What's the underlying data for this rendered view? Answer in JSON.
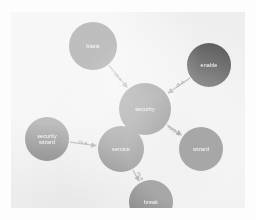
{
  "diagram": {
    "background_color": "#eeeeee",
    "page_background": "#fdfdfd",
    "node_color": "#6e6e6e",
    "node_color_dark": "#4a4a4a",
    "edge_color": "#9a9a9a",
    "node_label_color": "#ffffff",
    "edge_label_color": "#555555"
  },
  "chart_data": {
    "type": "diagram",
    "nodes": [
      {
        "id": "blank",
        "label": "blank",
        "label_lines": [
          "blank"
        ],
        "x": 82,
        "y": 34,
        "r": 24,
        "color": "#6e6e6e"
      },
      {
        "id": "enable",
        "label": "enable",
        "label_lines": [
          "enable"
        ],
        "x": 198,
        "y": 53,
        "r": 22,
        "color": "#4a4a4a"
      },
      {
        "id": "security",
        "label": "security",
        "label_lines": [
          "security"
        ],
        "x": 134,
        "y": 97,
        "r": 26,
        "color": "#6e6e6e"
      },
      {
        "id": "security-wizard",
        "label": "security wizard",
        "label_lines": [
          "security",
          "wizard"
        ],
        "x": 36,
        "y": 127,
        "r": 22,
        "color": "#6e6e6e"
      },
      {
        "id": "service",
        "label": "service",
        "label_lines": [
          "service"
        ],
        "x": 110,
        "y": 137,
        "r": 23,
        "color": "#6e6e6e"
      },
      {
        "id": "wizard",
        "label": "wizard",
        "label_lines": [
          "wizard"
        ],
        "x": 190,
        "y": 137,
        "r": 22,
        "color": "#6e6e6e"
      },
      {
        "id": "break",
        "label": "break",
        "label_lines": [
          "break"
        ],
        "x": 140,
        "y": 190,
        "r": 22,
        "color": "#6e6e6e"
      }
    ],
    "edges": [
      {
        "from": "blank",
        "to": "security",
        "label": "IS-A",
        "label_x": 106,
        "label_y": 66
      },
      {
        "from": "enable",
        "to": "security",
        "label": "IS-A",
        "label_x": 170,
        "label_y": 73
      },
      {
        "from": "security",
        "to": "wizard",
        "label": "HAS-A",
        "label_x": 162,
        "label_y": 120
      },
      {
        "from": "security-wizard",
        "to": "service",
        "label": "IS-A",
        "label_x": 72,
        "label_y": 132
      },
      {
        "from": "service",
        "to": "break",
        "label": "IS-A",
        "label_x": 128,
        "label_y": 165
      }
    ],
    "legend": [],
    "grid": false
  }
}
